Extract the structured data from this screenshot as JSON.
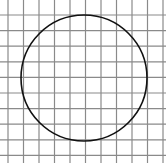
{
  "figure": {
    "width": 166,
    "height": 163,
    "background": "#ffffff",
    "grid": {
      "color": "#8a8a8a",
      "line_width": 1.2,
      "vertical_lines_x": [
        8,
        23.5,
        39,
        54.5,
        70,
        85.5,
        101,
        116.5,
        132,
        147.5,
        163
      ],
      "horizontal_lines_y": [
        15,
        30.6,
        46.2,
        61.8,
        77.4,
        93,
        108.6,
        124.2,
        139.8,
        155.4
      ],
      "spacing": 15.5
    },
    "circle": {
      "cx": 84,
      "cy": 78,
      "r": 63,
      "stroke": "#111111",
      "stroke_width": 1.6,
      "fill": "none"
    }
  }
}
